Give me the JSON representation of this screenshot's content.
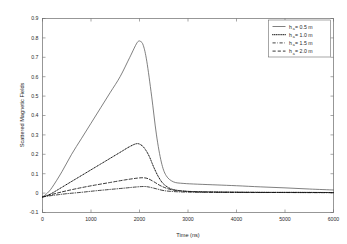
{
  "chart_data": {
    "type": "line",
    "title": "",
    "xlabel": "Time (ns)",
    "ylabel": "Scattered Magnetic Fields",
    "xlim": [
      0,
      6000
    ],
    "ylim": [
      -0.1,
      0.9
    ],
    "xticks": [
      0,
      1000,
      2000,
      3000,
      4000,
      5000,
      6000
    ],
    "xtick_labels": [
      "0",
      "1000",
      "2000",
      "3000",
      "4000",
      "5000",
      "6000"
    ],
    "yticks": [
      -0.1,
      0,
      0.1,
      0.2,
      0.3,
      0.4,
      0.5,
      0.6,
      0.7,
      0.8,
      0.9
    ],
    "ytick_labels": [
      "-0.1",
      "0",
      "0.1",
      "0.2",
      "0.3",
      "0.4",
      "0.5",
      "0.6",
      "0.7",
      "0.8",
      "0.9"
    ],
    "grid": false,
    "legend_position": "upper right",
    "series": [
      {
        "name": "h_a = 0.5 m",
        "label_prefix": "h",
        "label_sub": "a",
        "label_suffix": " = 0.5 m",
        "style": "solid",
        "width": 0.75,
        "color": "#555555",
        "x": [
          0,
          100,
          200,
          400,
          600,
          800,
          1000,
          1200,
          1400,
          1600,
          1800,
          1950,
          2020,
          2080,
          2150,
          2250,
          2350,
          2450,
          2550,
          2700,
          2900,
          3200,
          3600,
          4000,
          4500,
          5000,
          5500,
          6000
        ],
        "y": [
          -0.02,
          0.0,
          0.03,
          0.11,
          0.2,
          0.28,
          0.36,
          0.44,
          0.52,
          0.6,
          0.7,
          0.775,
          0.782,
          0.76,
          0.68,
          0.5,
          0.3,
          0.16,
          0.09,
          0.058,
          0.05,
          0.046,
          0.042,
          0.038,
          0.032,
          0.027,
          0.021,
          0.016
        ]
      },
      {
        "name": "h_a = 1.0 m",
        "label_prefix": "h",
        "label_sub": "a",
        "label_suffix": " = 1.0 m",
        "style": "dotted",
        "width": 1.0,
        "color": "#141414",
        "x": [
          0,
          100,
          200,
          400,
          600,
          800,
          1000,
          1200,
          1400,
          1600,
          1800,
          1950,
          2050,
          2120,
          2200,
          2300,
          2400,
          2500,
          2650,
          2850,
          3100,
          3500,
          4000,
          4600,
          5200,
          6000
        ],
        "y": [
          -0.02,
          -0.012,
          0.0,
          0.03,
          0.06,
          0.09,
          0.12,
          0.15,
          0.18,
          0.21,
          0.24,
          0.255,
          0.245,
          0.225,
          0.19,
          0.13,
          0.08,
          0.046,
          0.022,
          0.012,
          0.008,
          0.006,
          0.005,
          0.004,
          0.004,
          0.003
        ]
      },
      {
        "name": "h_a = 1.5 m",
        "label_prefix": "h",
        "label_sub": "a",
        "label_suffix": " = 1.5 m",
        "style": "dashdot",
        "width": 0.8,
        "color": "#141414",
        "x": [
          0,
          150,
          300,
          500,
          800,
          1100,
          1400,
          1700,
          1950,
          2100,
          2200,
          2350,
          2500,
          2700,
          3000,
          3500,
          4200,
          5000,
          6000
        ],
        "y": [
          -0.02,
          -0.014,
          -0.009,
          -0.003,
          0.004,
          0.012,
          0.019,
          0.026,
          0.032,
          0.034,
          0.031,
          0.022,
          0.013,
          0.008,
          0.005,
          0.004,
          0.003,
          0.003,
          0.002
        ]
      },
      {
        "name": "h_a = 2.0 m",
        "label_prefix": "h",
        "label_sub": "a",
        "label_suffix": " = 2.0 m",
        "style": "dashed",
        "width": 0.85,
        "color": "#141414",
        "x": [
          0,
          150,
          300,
          500,
          800,
          1100,
          1400,
          1700,
          1950,
          2080,
          2180,
          2300,
          2450,
          2650,
          2900,
          3300,
          4000,
          5000,
          6000
        ],
        "y": [
          -0.02,
          -0.01,
          0.0,
          0.012,
          0.028,
          0.042,
          0.055,
          0.068,
          0.077,
          0.079,
          0.074,
          0.058,
          0.036,
          0.018,
          0.01,
          0.006,
          0.004,
          0.003,
          0.003
        ]
      }
    ]
  }
}
